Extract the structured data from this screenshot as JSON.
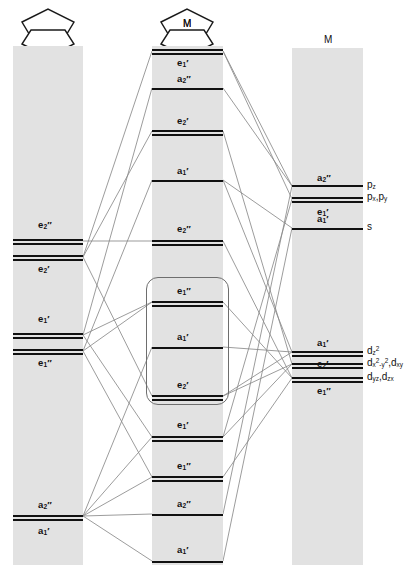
{
  "figure": {
    "type": "molecular-orbital-correlation-diagram",
    "title": "",
    "columns": 3
  },
  "headers": {
    "left_fragment": "",
    "middle_label": "M",
    "right_label": "M"
  },
  "ligand_column": {
    "name": "cyclopentadienyl-ligand-set",
    "levels": [
      {
        "id": "lig-e2dp",
        "label": "e",
        "sub": "2",
        "prime": "\"",
        "y": 240,
        "style": "double"
      },
      {
        "id": "lig-e2p",
        "label": "e",
        "sub": "2",
        "prime": "'",
        "y": 256,
        "style": "double"
      },
      {
        "id": "lig-e1p",
        "label": "e",
        "sub": "1",
        "prime": "'",
        "y": 334,
        "style": "double"
      },
      {
        "id": "lig-e1dp",
        "label": "e",
        "sub": "1",
        "prime": "\"",
        "y": 350,
        "style": "double"
      },
      {
        "id": "lig-a2dp",
        "label": "a",
        "sub": "2",
        "prime": "\"",
        "y": 516,
        "style": "double"
      }
    ],
    "text_labels": [
      {
        "text": "e",
        "sub": "2",
        "prime": "\"",
        "y": 224
      },
      {
        "text": "e",
        "sub": "2",
        "prime": "'",
        "y": 268
      },
      {
        "text": "e",
        "sub": "1",
        "prime": "'",
        "y": 318
      },
      {
        "text": "e",
        "sub": "1",
        "prime": "\"",
        "y": 362
      },
      {
        "text": "a",
        "sub": "2",
        "prime": "\"",
        "y": 504
      },
      {
        "text": "a",
        "sub": "1",
        "prime": "'",
        "y": 530
      }
    ]
  },
  "mo_column": {
    "name": "metallocene-molecular-orbitals",
    "levels": [
      {
        "id": "mo-e1p-top",
        "label": "e",
        "sub": "1",
        "prime": "'",
        "y": 50,
        "style": "double"
      },
      {
        "id": "mo-a2dp-1",
        "label": "a",
        "sub": "2",
        "prime": "\"",
        "y": 88,
        "style": "single"
      },
      {
        "id": "mo-e2p-1",
        "label": "e",
        "sub": "2",
        "prime": "'",
        "y": 131,
        "style": "double"
      },
      {
        "id": "mo-a1p-1",
        "label": "a",
        "sub": "1",
        "prime": "'",
        "y": 180,
        "style": "single"
      },
      {
        "id": "mo-e2dp-1",
        "label": "e",
        "sub": "2",
        "prime": "\"",
        "y": 241,
        "style": "double"
      },
      {
        "id": "mo-e1dp-box",
        "label": "e",
        "sub": "1",
        "prime": "\"",
        "y": 302,
        "style": "double"
      },
      {
        "id": "mo-a1p-box",
        "label": "a",
        "sub": "1",
        "prime": "'",
        "y": 347,
        "style": "single"
      },
      {
        "id": "mo-e2p-box",
        "label": "e",
        "sub": "2",
        "prime": "'",
        "y": 396,
        "style": "double"
      },
      {
        "id": "mo-e1p-2",
        "label": "e",
        "sub": "1",
        "prime": "'",
        "y": 437,
        "style": "double"
      },
      {
        "id": "mo-e1dp-2",
        "label": "e",
        "sub": "1",
        "prime": "\"",
        "y": 477,
        "style": "double"
      },
      {
        "id": "mo-a2dp-2",
        "label": "a",
        "sub": "2",
        "prime": "\"",
        "y": 514,
        "style": "single"
      },
      {
        "id": "mo-a1p-2",
        "label": "a",
        "sub": "1",
        "prime": "'",
        "y": 561,
        "style": "single"
      }
    ],
    "text_labels": [
      {
        "text": "e",
        "sub": "1",
        "prime": "'",
        "y": 62
      },
      {
        "text": "a",
        "sub": "2",
        "prime": "\"",
        "y": 78
      },
      {
        "text": "e",
        "sub": "2",
        "prime": "'",
        "y": 120
      },
      {
        "text": "a",
        "sub": "1",
        "prime": "'",
        "y": 170
      },
      {
        "text": "e",
        "sub": "2",
        "prime": "\"",
        "y": 228
      },
      {
        "text": "e",
        "sub": "1",
        "prime": "\"",
        "y": 290
      },
      {
        "text": "a",
        "sub": "1",
        "prime": "'",
        "y": 336
      },
      {
        "text": "e",
        "sub": "2",
        "prime": "'",
        "y": 384
      },
      {
        "text": "e",
        "sub": "1",
        "prime": "'",
        "y": 424
      },
      {
        "text": "e",
        "sub": "1",
        "prime": "\"",
        "y": 465
      },
      {
        "text": "a",
        "sub": "2",
        "prime": "\"",
        "y": 503
      },
      {
        "text": "a",
        "sub": "1",
        "prime": "'",
        "y": 549
      }
    ],
    "frontier_group": {
      "name": "frontier-orbital-group",
      "top": 277,
      "height": 128
    }
  },
  "metal_column": {
    "name": "metal-atomic-orbitals",
    "header": "M",
    "levels": [
      {
        "id": "m-a2dp",
        "label": "a",
        "sub": "2",
        "prime": "\"",
        "y": 186,
        "style": "single",
        "ao": "p_z"
      },
      {
        "id": "m-e1p",
        "label": "e",
        "sub": "1",
        "prime": "'",
        "y": 199,
        "style": "double",
        "ao": "p_x,p_y"
      },
      {
        "id": "m-a1p",
        "label": "a",
        "sub": "1",
        "prime": "'",
        "y": 228,
        "style": "single",
        "ao": "s"
      },
      {
        "id": "m-a1p-d",
        "label": "a",
        "sub": "1",
        "prime": "'",
        "y": 352,
        "style": "double",
        "ao": "d_z2"
      },
      {
        "id": "m-e2p-d",
        "label": "e",
        "sub": "2",
        "prime": "'",
        "y": 364,
        "style": "double",
        "ao": "d_x2-y2,d_xy"
      },
      {
        "id": "m-e1dp-d",
        "label": "e",
        "sub": "1",
        "prime": "\"",
        "y": 378,
        "style": "double",
        "ao": "d_yz,d_zx"
      }
    ],
    "text_labels": [
      {
        "text": "a",
        "sub": "2",
        "prime": "\"",
        "y": 176
      },
      {
        "text": "e",
        "sub": "1",
        "prime": "'",
        "y": 212
      },
      {
        "text": "a",
        "sub": "1",
        "prime": "'",
        "y": 217
      },
      {
        "text": "a",
        "sub": "1",
        "prime": "'",
        "y": 341
      },
      {
        "text": "e",
        "sub": "2",
        "prime": "'",
        "y": 364
      },
      {
        "text": "e",
        "sub": "1",
        "prime": "\"",
        "y": 390
      }
    ],
    "ao_captions": [
      {
        "id": "ao-pz",
        "base": "p",
        "sub": "z",
        "y": 186
      },
      {
        "id": "ao-pxpy",
        "base": "p",
        "sub": "x",
        "base2": "p",
        "sub2": "y",
        "y": 199
      },
      {
        "id": "ao-s",
        "base": "s",
        "sub": "",
        "y": 228
      },
      {
        "id": "ao-dz2",
        "base": "d",
        "sub": "z",
        "sup": "2",
        "y": 352
      },
      {
        "id": "ao-dx2y2",
        "base": "d",
        "sub": "x",
        "y": 365
      },
      {
        "id": "ao-dyzzx",
        "base": "d",
        "sub": "yz",
        "y": 379
      }
    ],
    "ao_text": {
      "pz": "p",
      "pz_sub": "z",
      "pxpy": "p",
      "s": "s",
      "dz2": "d",
      "dx2y2": "d",
      "dyzzx": "d"
    }
  },
  "ao_labels_rendered": {
    "pz": "pz",
    "pxpy": "px,py",
    "s": "s",
    "dz2": "dz2",
    "dx2y2_dxy": "dx2-y2,dxy",
    "dyz_dzx": "dyz,dzx"
  },
  "colors": {
    "band": "#e2e2e2",
    "level_line": "#111111",
    "correlation_line": "#8a8a8a",
    "box_border": "#6e6e6e",
    "background": "#ffffff"
  },
  "structures": {
    "ligand_fragment_name": "two-cyclopentadienyl-rings",
    "metallocene_name": "metallocene-sandwich",
    "metal_center_symbol": "M"
  }
}
